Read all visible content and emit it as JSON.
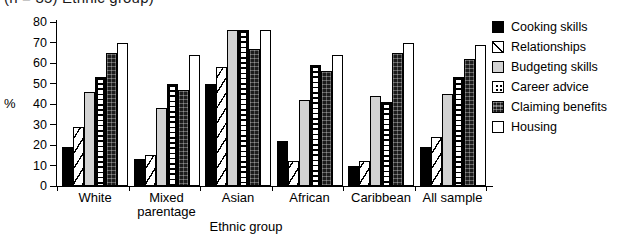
{
  "figure": {
    "clipped_title": "(n = 35)   Ethnic group)"
  },
  "axes": {
    "y_title": "%",
    "x_title": "Ethnic group",
    "y_ticks": [
      "0",
      "10",
      "20",
      "30",
      "40",
      "50",
      "60",
      "70",
      "80"
    ]
  },
  "legend": {
    "items": [
      {
        "label": "Cooking skills",
        "pattern": "solid-black"
      },
      {
        "label": "Relationships",
        "pattern": "diagonal-hatch"
      },
      {
        "label": "Budgeting skills",
        "pattern": "light-gray"
      },
      {
        "label": "Career advice",
        "pattern": "dotted"
      },
      {
        "label": "Claiming benefits",
        "pattern": "dark-texture"
      },
      {
        "label": "Housing",
        "pattern": "white-outline"
      }
    ]
  },
  "chart_data": {
    "type": "bar",
    "title": "",
    "xlabel": "Ethnic group",
    "ylabel": "%",
    "ylim": [
      0,
      80
    ],
    "ytick_step": 10,
    "grid": false,
    "legend_position": "right",
    "categories": [
      "White",
      "Mixed parentage",
      "Asian",
      "African",
      "Caribbean",
      "All sample"
    ],
    "series": [
      {
        "name": "Cooking skills",
        "values": [
          19,
          13,
          50,
          22,
          10,
          19
        ]
      },
      {
        "name": "Relationships",
        "values": [
          29,
          15,
          58,
          12,
          12,
          24
        ]
      },
      {
        "name": "Budgeting skills",
        "values": [
          46,
          38,
          76,
          42,
          44,
          45
        ]
      },
      {
        "name": "Career advice",
        "values": [
          53,
          50,
          76,
          59,
          41,
          53
        ]
      },
      {
        "name": "Claiming benefits",
        "values": [
          65,
          47,
          67,
          56,
          65,
          62
        ]
      },
      {
        "name": "Housing",
        "values": [
          70,
          64,
          76,
          64,
          70,
          69
        ]
      }
    ]
  },
  "colors": {
    "axis": "#000000",
    "bar_black": "#000000",
    "bar_gray": "#d2d2d2",
    "bar_dark": "#1c1c1c",
    "bar_white": "#ffffff",
    "background": "#ffffff"
  }
}
